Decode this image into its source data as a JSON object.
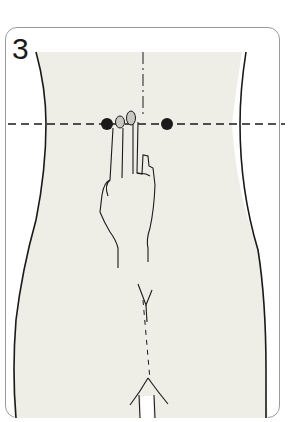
{
  "figure": {
    "step_number": "3",
    "colors": {
      "skin_fill": "#efeee6",
      "outline": "#1a1a1a",
      "frame": "#9a9a9a",
      "point": "#1a1a1a",
      "fingernail": "#c8c8c0"
    },
    "markers": [
      {
        "name": "left-point",
        "x": 107,
        "y": 124
      },
      {
        "name": "right-point",
        "x": 167,
        "y": 124
      }
    ],
    "guide_line": {
      "style": "dashed",
      "y": 124
    }
  }
}
